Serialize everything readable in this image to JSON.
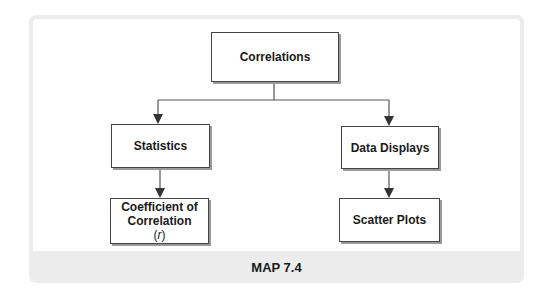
{
  "diagram": {
    "nodes": {
      "root": {
        "label": "Correlations"
      },
      "statistics": {
        "label": "Statistics"
      },
      "data_displays": {
        "label": "Data Displays"
      },
      "coefficient": {
        "line1": "Coefficient of",
        "line2": "Correlation",
        "symbol_open": "(",
        "symbol": "r",
        "symbol_close": ")"
      },
      "scatter_plots": {
        "label": "Scatter Plots"
      }
    },
    "edges": [
      {
        "from": "Correlations",
        "to": "Statistics"
      },
      {
        "from": "Correlations",
        "to": "Data Displays"
      },
      {
        "from": "Statistics",
        "to": "Coefficient of Correlation (r)"
      },
      {
        "from": "Data Displays",
        "to": "Scatter Plots"
      }
    ],
    "caption": "MAP 7.4"
  }
}
